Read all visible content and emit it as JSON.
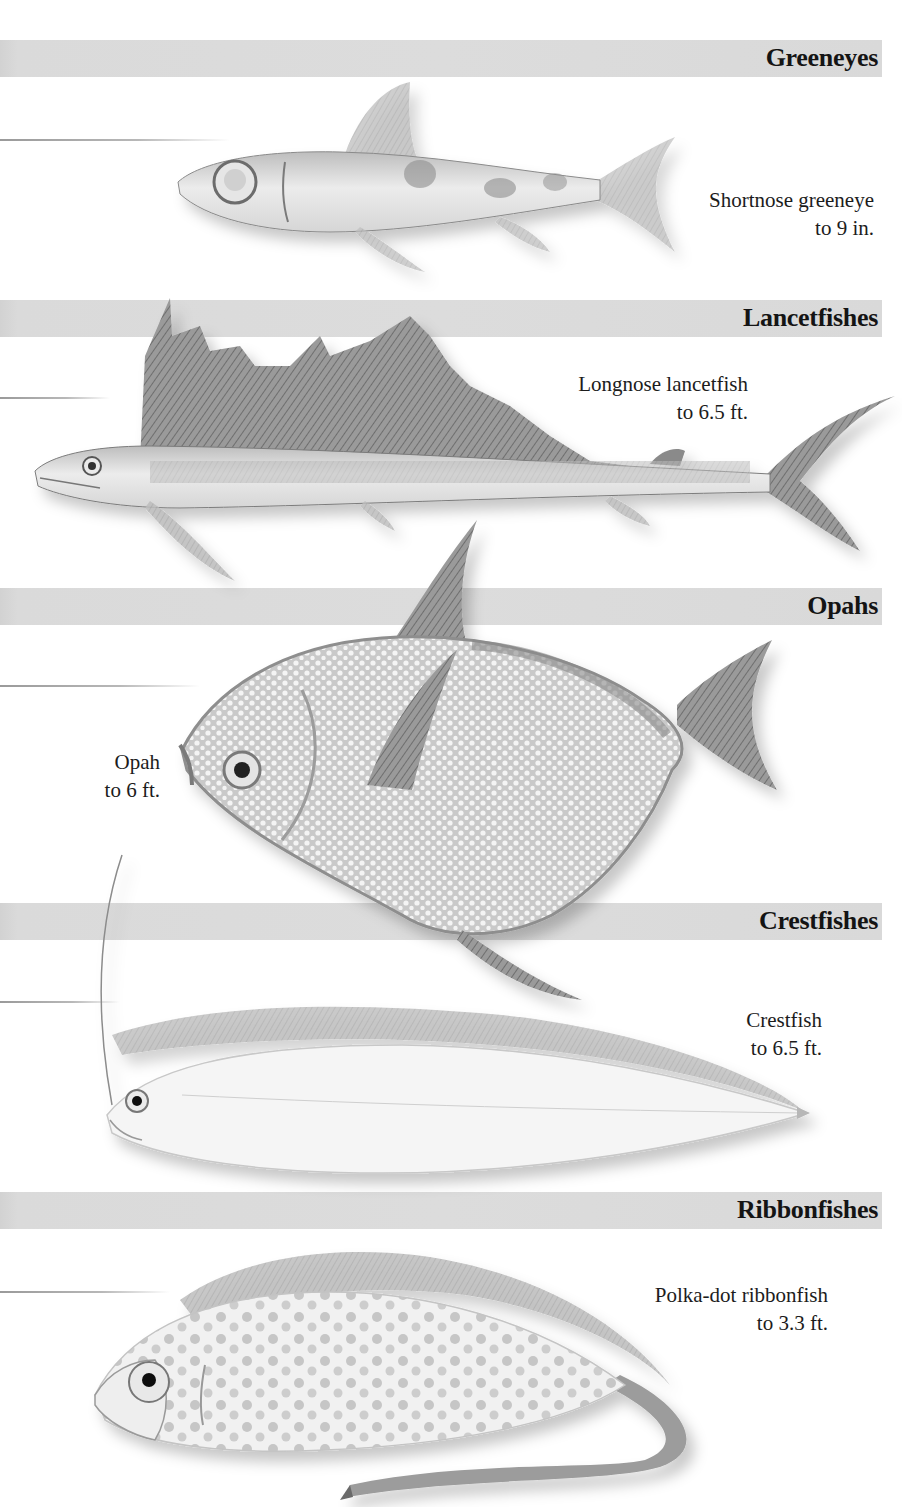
{
  "page": {
    "background": "#ffffff",
    "band_color": "#dcdcdc"
  },
  "sections": [
    {
      "family": "Greeneyes",
      "species": "Shortnose greeneye",
      "size": "to 9 in.",
      "icon": "shortnose-greeneye-illustration"
    },
    {
      "family": "Lancetfishes",
      "species": "Longnose lancetfish",
      "size": "to 6.5 ft.",
      "icon": "longnose-lancetfish-illustration"
    },
    {
      "family": "Opahs",
      "species": "Opah",
      "size": "to 6 ft.",
      "icon": "opah-illustration"
    },
    {
      "family": "Crestfishes",
      "species": "Crestfish",
      "size": "to 6.5 ft.",
      "icon": "crestfish-illustration"
    },
    {
      "family": "Ribbonfishes",
      "species": "Polka-dot ribbonfish",
      "size": "to 3.3 ft.",
      "icon": "polka-dot-ribbonfish-illustration"
    }
  ]
}
